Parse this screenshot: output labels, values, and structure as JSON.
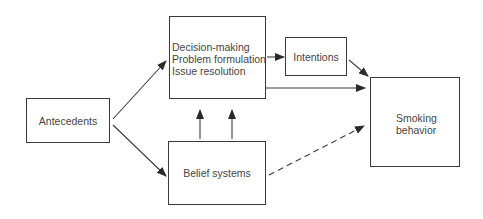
{
  "diagram": {
    "nodes": {
      "antecedents": {
        "label": "Antecedents"
      },
      "decision": {
        "lines": [
          "Decision-making",
          "Problem formulation",
          "Issue resolution"
        ]
      },
      "intentions": {
        "label": "Intentions"
      },
      "smoking": {
        "line1": "Smoking",
        "line2": "behavior"
      },
      "belief": {
        "label": "Belief systems"
      }
    },
    "edges": [
      {
        "from": "Antecedents",
        "to": "Decision-making",
        "style": "solid"
      },
      {
        "from": "Antecedents",
        "to": "Belief systems",
        "style": "solid"
      },
      {
        "from": "Belief systems",
        "to": "Decision-making",
        "style": "solid",
        "count": 2
      },
      {
        "from": "Decision-making",
        "to": "Intentions",
        "style": "solid"
      },
      {
        "from": "Intentions",
        "to": "Smoking behavior",
        "style": "solid"
      },
      {
        "from": "Decision-making",
        "to": "Smoking behavior",
        "style": "solid"
      },
      {
        "from": "Belief systems",
        "to": "Smoking behavior",
        "style": "dashed"
      }
    ],
    "colors": {
      "stroke": "#3a3a3a",
      "text": "#444444",
      "background": "#ffffff"
    }
  }
}
